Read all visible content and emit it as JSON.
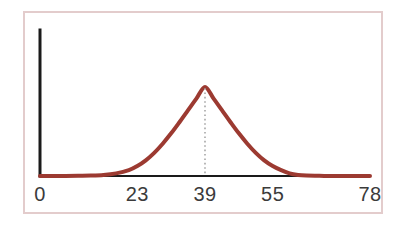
{
  "figure": {
    "width": 410,
    "height": 226,
    "background_color": "#ffffff",
    "frame_border_color": "#e3cccc",
    "frame_border_width": 2
  },
  "axes": {
    "axis_color": "#1a1a1a",
    "axis_line_width": 2,
    "y_axis_label": "",
    "x_axis_label": "",
    "y_tick_labels": [],
    "has_tick_marks": false,
    "has_gridlines": false
  },
  "marker": {
    "name": "peak-marker",
    "value": 39,
    "style": "dotted",
    "color": "#9a9a9a"
  },
  "curve": {
    "color": "#9c3a31",
    "line_width": 4,
    "style": "solid"
  },
  "chart_data": {
    "type": "line",
    "title": "",
    "subtitle": "",
    "xlabel": "",
    "ylabel": "",
    "xlim": [
      0,
      78
    ],
    "ylim": [
      0,
      1.15
    ],
    "grid": false,
    "legend": false,
    "legend_position": "none",
    "xticks": [
      0,
      23,
      39,
      55,
      78
    ],
    "xtick_labels": [
      "0",
      "23",
      "39",
      "55",
      "78"
    ],
    "yticks": [],
    "ytick_labels": [],
    "annotations": [
      {
        "name": "mean-line",
        "type": "vline",
        "x": 39,
        "label": "",
        "style": "dotted",
        "color": "#9a9a9a"
      }
    ],
    "series": [
      {
        "name": "normal-distribution",
        "color": "#9c3a31",
        "distribution": "gaussian",
        "mean": 39,
        "sigma": 8,
        "peak_value": 1.0,
        "x": [
          0,
          3,
          6,
          9,
          12,
          15,
          18,
          21,
          23,
          25,
          27,
          29,
          31,
          33,
          35,
          37,
          39,
          41,
          43,
          45,
          47,
          49,
          51,
          53,
          55,
          57,
          59,
          61,
          63,
          66,
          69,
          72,
          75,
          78
        ],
        "values": [
          0.0,
          0.0,
          0.0,
          0.001,
          0.002,
          0.005,
          0.013,
          0.029,
          0.049,
          0.077,
          0.114,
          0.159,
          0.21,
          0.266,
          0.324,
          0.382,
          0.438,
          0.382,
          0.324,
          0.266,
          0.21,
          0.159,
          0.114,
          0.077,
          0.049,
          0.029,
          0.013,
          0.005,
          0.002,
          0.001,
          0.0,
          0.0,
          0.0,
          0.0
        ]
      }
    ]
  }
}
